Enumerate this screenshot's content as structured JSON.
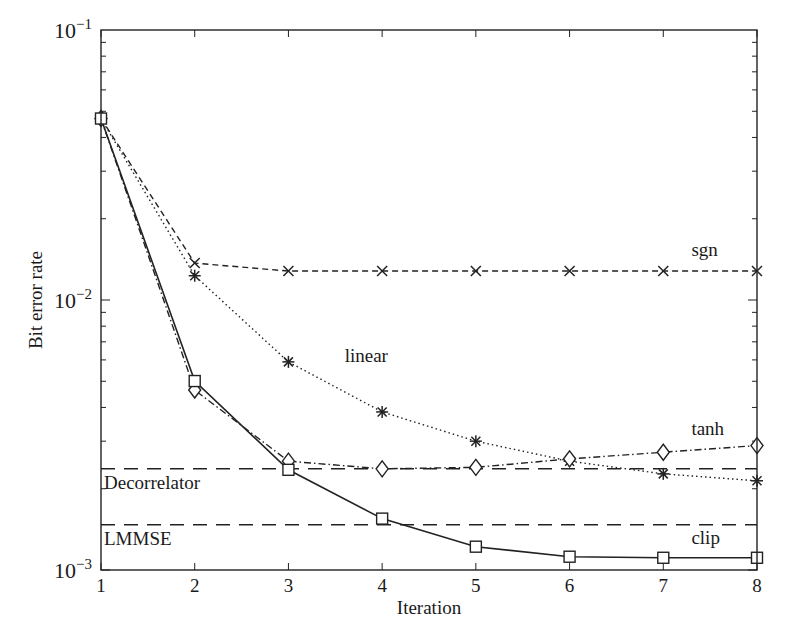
{
  "chart_data": {
    "type": "line",
    "title": "",
    "xlabel": "Iteration",
    "ylabel": "Bit error rate",
    "yscale": "log",
    "xlim": [
      1,
      8
    ],
    "ylim": [
      0.001,
      0.1
    ],
    "x": [
      1,
      2,
      3,
      4,
      5,
      6,
      7,
      8
    ],
    "x_tick_labels": [
      "1",
      "2",
      "3",
      "4",
      "5",
      "6",
      "7",
      "8"
    ],
    "y_tick_labels": [
      {
        "value": 0.1,
        "base": "10",
        "exp": "−1"
      },
      {
        "value": 0.01,
        "base": "10",
        "exp": "−2"
      },
      {
        "value": 0.001,
        "base": "10",
        "exp": "−3"
      }
    ],
    "grid": false,
    "series": [
      {
        "name": "sgn",
        "marker": "x",
        "linestyle": "dashed",
        "values": [
          0.047,
          0.0137,
          0.0128,
          0.0128,
          0.0128,
          0.0128,
          0.0128,
          0.0128
        ],
        "label_pos": [
          7.3,
          0.0145
        ]
      },
      {
        "name": "linear",
        "marker": "asterisk",
        "linestyle": "dotted",
        "values": [
          0.047,
          0.0123,
          0.0059,
          0.00385,
          0.003,
          0.00253,
          0.00227,
          0.00214
        ],
        "label_pos": [
          3.6,
          0.0059
        ]
      },
      {
        "name": "tanh",
        "marker": "diamond",
        "linestyle": "dashdot",
        "values": [
          0.047,
          0.00464,
          0.00253,
          0.00237,
          0.0024,
          0.00258,
          0.00273,
          0.00289
        ],
        "label_pos": [
          7.3,
          0.00315
        ]
      },
      {
        "name": "clip",
        "marker": "square",
        "linestyle": "solid",
        "values": [
          0.047,
          0.00501,
          0.00235,
          0.00155,
          0.00122,
          0.00112,
          0.00111,
          0.00111
        ],
        "label_pos": [
          7.3,
          0.00125
        ]
      }
    ],
    "reference_lines": [
      {
        "name": "Decorrelator",
        "value": 0.00237,
        "linestyle": "longdash"
      },
      {
        "name": "LMMSE",
        "value": 0.00147,
        "linestyle": "longdash"
      }
    ],
    "legend": "inline labels"
  }
}
